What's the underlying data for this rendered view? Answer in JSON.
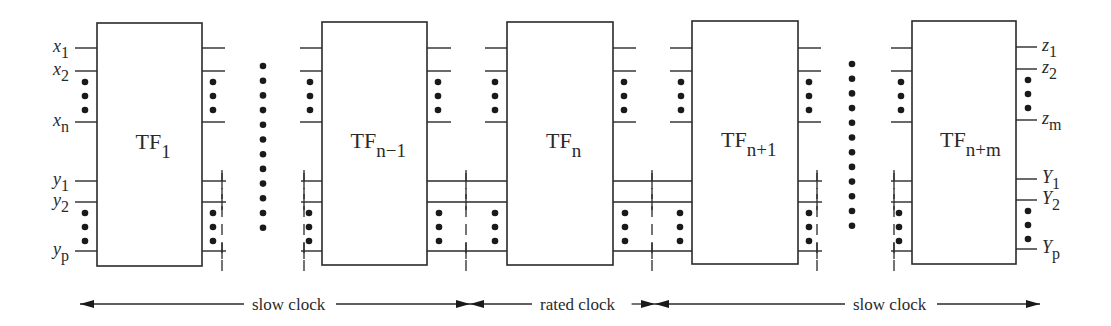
{
  "diagram": {
    "colors": {
      "stroke": "#2a2a2a",
      "dot": "#1a1a1a",
      "background": "#ffffff"
    },
    "time_frames": [
      {
        "id": "tf1",
        "label": "TF",
        "subscript": "1",
        "x": 97,
        "w": 105,
        "top": 23,
        "bottom": 266
      },
      {
        "id": "tfn-1",
        "label": "TF",
        "subscript": "n−1",
        "x": 322,
        "w": 105,
        "top": 22,
        "bottom": 265
      },
      {
        "id": "tfn",
        "label": "TF",
        "subscript": "n",
        "x": 507,
        "w": 106,
        "top": 22,
        "bottom": 265
      },
      {
        "id": "tfn+1",
        "label": "TF",
        "subscript": "n+1",
        "x": 692,
        "w": 106,
        "top": 21,
        "bottom": 264
      },
      {
        "id": "tfn+m",
        "label": "TF",
        "subscript": "n+m",
        "x": 912,
        "w": 104,
        "top": 21,
        "bottom": 264
      }
    ],
    "wire_rows": {
      "x1": 48,
      "x2": 71,
      "xn": 122,
      "y1": 181,
      "y2": 202,
      "yp": 251
    },
    "input_labels": [
      {
        "base": "x",
        "sub": "1",
        "y": 48
      },
      {
        "base": "x",
        "sub": "2",
        "y": 71
      },
      {
        "base": "x",
        "sub": "n",
        "y": 122
      },
      {
        "base": "y",
        "sub": "1",
        "y": 181
      },
      {
        "base": "y",
        "sub": "2",
        "y": 202
      },
      {
        "base": "y",
        "sub": "p",
        "y": 251
      }
    ],
    "output_labels": [
      {
        "base": "z",
        "sub": "1",
        "y": 47
      },
      {
        "base": "z",
        "sub": "2",
        "y": 69
      },
      {
        "base": "z",
        "sub": "m",
        "y": 120
      },
      {
        "base": "Y",
        "sub": "1",
        "y": 179
      },
      {
        "base": "Y",
        "sub": "2",
        "y": 200
      },
      {
        "base": "Y",
        "sub": "p",
        "y": 249
      }
    ],
    "ellipsis_columns": [
      {
        "x": 263,
        "y_start": 66,
        "count": 12,
        "spacing": 14.7
      },
      {
        "x": 852,
        "y_start": 64,
        "count": 12,
        "spacing": 14.7
      }
    ],
    "clock_regions": [
      {
        "label": "slow clock",
        "x_start": 80,
        "x_end": 470,
        "label_x": 252
      },
      {
        "label": "rated clock",
        "x_start": 470,
        "x_end": 655,
        "label_x": 540
      },
      {
        "label": "slow clock",
        "x_start": 655,
        "x_end": 1040,
        "label_x": 853
      }
    ],
    "clock_arrow_y": 304
  }
}
